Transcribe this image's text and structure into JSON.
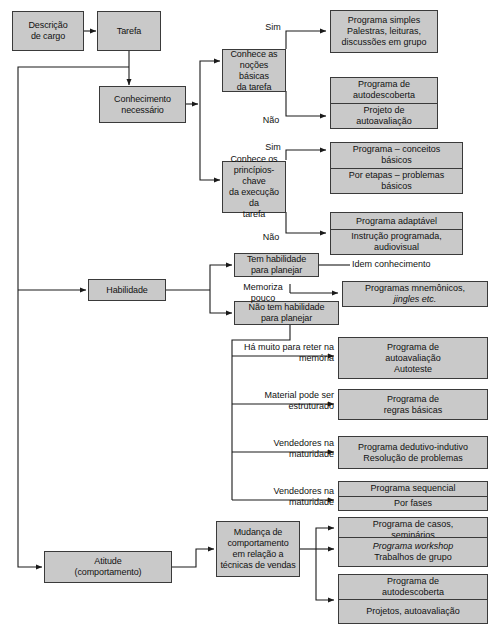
{
  "diagram": {
    "colors": {
      "box_fill": "#c9c9c9",
      "box_border": "#3a3a3a",
      "line": "#1a1a1a",
      "text": "#111111",
      "background": "#ffffff"
    },
    "nodes": {
      "descricao_cargo": {
        "lines": [
          "Descrição",
          "de cargo"
        ]
      },
      "tarefa": {
        "lines": [
          "Tarefa"
        ]
      },
      "conhecimento_necessario": {
        "lines": [
          "Conhecimento",
          "necessário"
        ]
      },
      "conhece_nocoes": {
        "lines": [
          "Conhece as",
          "noções básicas",
          "da tarefa"
        ]
      },
      "conhece_principios": {
        "lines": [
          "Conhece os",
          "princípios-chave",
          "da execução da",
          "tarefa"
        ]
      },
      "habilidade": {
        "lines": [
          "Habilidade"
        ]
      },
      "tem_habilidade": {
        "lines": [
          "Tem habilidade",
          "para planejar"
        ]
      },
      "nao_tem_habilidade": {
        "lines": [
          "Não tem habilidade",
          "para planejar"
        ]
      },
      "atitude": {
        "lines": [
          "Atitude",
          "(comportamento)"
        ]
      },
      "mudanca_comportamento": {
        "lines": [
          "Mudança de",
          "comportamento",
          "em relação a",
          "técnicas de vendas"
        ]
      }
    },
    "outcomes": {
      "programa_simples": {
        "segments": [
          {
            "lines": [
              "Programa simples",
              "Palestras, leituras,",
              "discussões em grupo"
            ]
          }
        ]
      },
      "autodescoberta_1": {
        "segments": [
          {
            "lines": [
              "Programa de",
              "autodescoberta"
            ]
          },
          {
            "lines": [
              "Projeto de",
              "autoavaliação"
            ]
          }
        ]
      },
      "conceitos_basicos": {
        "segments": [
          {
            "lines": [
              "Programa – conceitos",
              "básicos"
            ]
          },
          {
            "lines": [
              "Por etapas – problemas",
              "básicos"
            ]
          }
        ]
      },
      "programa_adaptavel": {
        "segments": [
          {
            "lines": [
              "Programa adaptável"
            ]
          },
          {
            "lines": [
              "Instrução programada,",
              "audiovisual"
            ]
          }
        ]
      },
      "mnemonicos": {
        "segments": [
          {
            "lines": [
              "Programas mnemônicos,",
              "jingles etc."
            ],
            "italic_words": [
              "jingles"
            ]
          }
        ]
      },
      "autoavaliacao_autoteste": {
        "segments": [
          {
            "lines": [
              "Programa de",
              "autoavaliação",
              "Autoteste"
            ]
          }
        ]
      },
      "regras_basicas": {
        "segments": [
          {
            "lines": [
              "Programa de",
              "regras básicas"
            ]
          }
        ]
      },
      "dedutivo_indutivo": {
        "segments": [
          {
            "lines": [
              "Programa dedutivo-indutivo",
              "Resolução de problemas"
            ]
          }
        ]
      },
      "sequencial": {
        "segments": [
          {
            "lines": [
              "Programa sequencial"
            ]
          },
          {
            "lines": [
              "Por fases"
            ]
          }
        ]
      },
      "casos_seminarios": {
        "segments": [
          {
            "lines": [
              "Programa de casos,",
              "seminários"
            ]
          },
          {
            "lines": [
              "Dramatização"
            ]
          }
        ]
      },
      "workshop": {
        "segments": [
          {
            "lines": [
              "Programa workshop",
              "Trabalhos de grupo"
            ],
            "italic_words": [
              "workshop"
            ]
          }
        ]
      },
      "autodescoberta_2": {
        "segments": [
          {
            "lines": [
              "Programa de",
              "autodescoberta"
            ]
          },
          {
            "lines": [
              "Projetos, autoavaliação"
            ]
          }
        ]
      }
    },
    "edge_labels": {
      "sim_1": "Sim",
      "nao_1": "Não",
      "sim_2": "Sim",
      "nao_2": "Não",
      "idem_conhecimento": "Idem conhecimento",
      "memoriza_pouco": {
        "lines": [
          "Memoriza",
          "pouco"
        ]
      },
      "ha_muito_reter": {
        "lines": [
          "Há muito para",
          "reter na memória"
        ]
      },
      "material_estruturado": {
        "lines": [
          "Material pode",
          "ser estruturado"
        ]
      },
      "vendedores_maturidade_1": {
        "lines": [
          "Vendedores na",
          "maturidade"
        ]
      },
      "vendedores_maturidade_2": {
        "lines": [
          "Vendedores na",
          "maturidade"
        ]
      }
    }
  }
}
